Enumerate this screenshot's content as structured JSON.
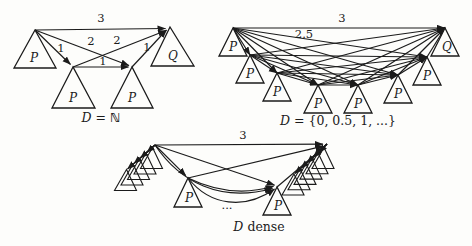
{
  "colors": {
    "background": "#fdfdfb",
    "ink": "#1b1b1b"
  },
  "figures": {
    "nat": {
      "caption": {
        "d": "D",
        "eq": "=",
        "set": "ℕ"
      },
      "edges": {
        "top": "3",
        "a_to_c": "1",
        "a_to_d": "2",
        "c_to_b": "2",
        "c_to_d": "1",
        "d_to_b": "1"
      },
      "nodes": {
        "top_left": "P",
        "top_right": "Q",
        "bottom_left": "P",
        "bottom_right": "P"
      }
    },
    "half_steps": {
      "caption": {
        "d": "D",
        "rest": "= {0, 0.5, 1, ...}"
      },
      "edges": {
        "top": "3",
        "to_second_last": "2.5"
      },
      "p_labels": [
        "P",
        "P",
        "P",
        "P",
        "P",
        "P",
        "P"
      ],
      "q_label": "Q"
    },
    "dense": {
      "caption": {
        "d": "D",
        "rest": "dense"
      },
      "edges": {
        "top": "3"
      },
      "ellipsis": "...",
      "p_left": "P",
      "p_right": "P"
    }
  }
}
